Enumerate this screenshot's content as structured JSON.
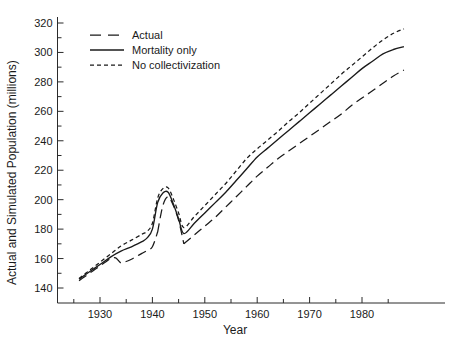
{
  "chart_data": {
    "type": "line",
    "title": "",
    "xlabel": "Year",
    "ylabel": "Actual and Simulated Population (millions)",
    "xlim": [
      1925,
      1989
    ],
    "ylim": [
      133,
      325
    ],
    "grid": false,
    "legend_position": "top-left",
    "x_ticks_major": [
      1930,
      1940,
      1950,
      1960,
      1970,
      1980
    ],
    "x_ticks_minor": [
      1925,
      1935,
      1945,
      1955,
      1965,
      1975,
      1985
    ],
    "y_ticks_major": [
      140,
      160,
      180,
      200,
      220,
      240,
      260,
      280,
      300,
      320
    ],
    "y_ticks_minor": [
      150,
      170,
      190,
      210,
      230,
      250,
      270,
      290,
      310
    ],
    "x_tick_labels": [
      "1930",
      "1940",
      "1950",
      "1960",
      "1970",
      "1980"
    ],
    "y_tick_labels": [
      "140",
      "160",
      "180",
      "200",
      "220",
      "240",
      "260",
      "280",
      "300",
      "320"
    ],
    "series": [
      {
        "name": "Actual",
        "style": "long-dash",
        "color": "#1a1a1a",
        "segments": [
          {
            "x": [
              1926,
              1927,
              1928,
              1929,
              1930,
              1931,
              1932,
              1933,
              1934,
              1935,
              1936,
              1937,
              1938,
              1939,
              1940,
              1941
            ],
            "y": [
              145.0,
              147.5,
              150.0,
              152.5,
              155.0,
              157.5,
              160.0,
              160.5,
              157.0,
              158.0,
              159.5,
              161.5,
              163.5,
              165.5,
              168.0,
              178.0
            ]
          },
          {
            "x": [
              1941,
              1942,
              1943,
              1944,
              1945,
              1946
            ],
            "y": [
              178.0,
              196.0,
              202.0,
              196.0,
              186.0,
              170.0
            ]
          },
          {
            "x": [
              1946,
              1948,
              1950,
              1952,
              1954,
              1956,
              1958,
              1960,
              1962,
              1964,
              1966,
              1968,
              1970,
              1972,
              1974,
              1976,
              1978,
              1980,
              1982,
              1984,
              1986,
              1988
            ],
            "y": [
              170.0,
              176.0,
              182.0,
              188.0,
              195.0,
              202.0,
              209.0,
              216.0,
              222.0,
              228.0,
              233.0,
              238.0,
              243.0,
              248.0,
              253.0,
              258.0,
              264.0,
              269.0,
              274.0,
              279.0,
              284.0,
              288.0
            ]
          }
        ]
      },
      {
        "name": "Mortality only",
        "style": "solid",
        "color": "#1a1a1a",
        "segments": [
          {
            "x": [
              1926,
              1928,
              1930,
              1932,
              1934,
              1936,
              1938,
              1939,
              1940,
              1941,
              1942,
              1943,
              1944,
              1945,
              1946,
              1948,
              1950,
              1952,
              1954,
              1956,
              1958,
              1960,
              1962,
              1964,
              1966,
              1968,
              1970,
              1972,
              1974,
              1976,
              1978,
              1980,
              1982,
              1984,
              1986,
              1988
            ],
            "y": [
              146.0,
              151.0,
              156.0,
              161.0,
              165.0,
              168.0,
              171.5,
              174.0,
              180.0,
              198.0,
              204.5,
              205.0,
              197.0,
              187.0,
              177.0,
              184.0,
              191.0,
              198.0,
              205.0,
              213.0,
              221.0,
              229.0,
              235.0,
              241.0,
              247.0,
              253.0,
              259.0,
              265.0,
              271.0,
              277.0,
              283.0,
              289.0,
              294.0,
              299.0,
              302.0,
              304.0
            ]
          }
        ]
      },
      {
        "name": "No collectivization",
        "style": "short-dash",
        "color": "#1a1a1a",
        "segments": [
          {
            "x": [
              1926,
              1928,
              1930,
              1932,
              1934,
              1936,
              1938,
              1939,
              1940,
              1941,
              1942,
              1943,
              1944,
              1945,
              1946,
              1948,
              1950,
              1952,
              1954,
              1956,
              1958,
              1960,
              1962,
              1964,
              1966,
              1968,
              1970,
              1972,
              1974,
              1976,
              1978,
              1980,
              1982,
              1984,
              1986,
              1988
            ],
            "y": [
              146.5,
              152.0,
              157.5,
              163.0,
              168.5,
              172.5,
              176.5,
              178.5,
              184.0,
              201.0,
              207.5,
              208.0,
              200.5,
              191.0,
              181.0,
              188.5,
              196.0,
              203.5,
              211.0,
              219.5,
              228.0,
              234.5,
              240.5,
              246.5,
              253.0,
              259.0,
              265.5,
              272.0,
              278.5,
              285.0,
              291.0,
              297.0,
              303.0,
              308.5,
              313.0,
              316.0
            ]
          }
        ]
      }
    ]
  },
  "legend": {
    "items": [
      {
        "label": "Actual",
        "style": "long-dash"
      },
      {
        "label": "Mortality only",
        "style": "solid"
      },
      {
        "label": "No collectivization",
        "style": "short-dash"
      }
    ]
  },
  "axes": {
    "x_title": "Year",
    "y_title": "Actual and Simulated Population (millions)"
  }
}
